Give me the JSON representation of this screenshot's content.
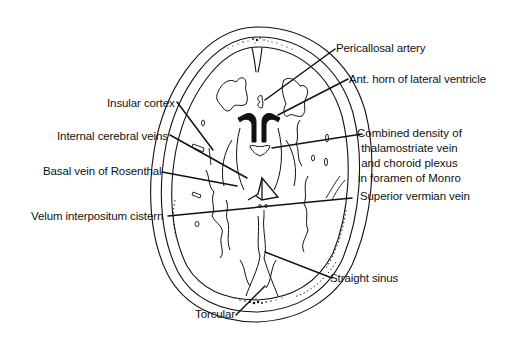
{
  "figure": {
    "type": "anatomical line drawing",
    "colors": {
      "ink": "#111111",
      "background": "#ffffff"
    }
  },
  "labels": {
    "pericallosal_artery": "Pericallosal artery",
    "ant_horn": "Ant. horn of lateral ventricle",
    "insular_cortex": "Insular cortex",
    "internal_cerebral_veins": "Internal cerebral  veins",
    "combined_density": {
      "line1": "Combined density of",
      "line2": "thalamostriate vein",
      "line3": "and choroid plexus",
      "line4": "in foramen of Monro"
    },
    "basal_vein": "Basal vein of Rosenthal",
    "velum_interpositum": "Velum interpositum  cistern",
    "superior_vermian_vein": "Superior vermian vein",
    "straight_sinus": "Straight sinus",
    "torcular": "Torcular"
  }
}
